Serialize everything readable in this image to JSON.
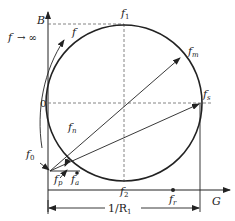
{
  "diagram": {
    "axes": {
      "vertical": "B",
      "horizontal": "G",
      "origin_label": "0"
    },
    "labels": {
      "f_inf": "f",
      "inf_arrow": "→ ∞",
      "f_dir": "f",
      "f1": "f",
      "f1_sub": "1",
      "fm": "f",
      "fm_sub": "m",
      "fs": "f",
      "fs_sub": "s",
      "fn": "f",
      "fn_sub": "n",
      "f0": "f",
      "f0_sub": "0",
      "fp": "f",
      "fp_sub": "p",
      "fa": "f",
      "fa_sub": "a",
      "fr": "f",
      "fr_sub": "r",
      "f2": "f",
      "f2_sub": "2",
      "dimension": "1/R",
      "dimension_sub": "1"
    },
    "colors": {
      "line": "#222222",
      "dash": "#555555"
    }
  }
}
